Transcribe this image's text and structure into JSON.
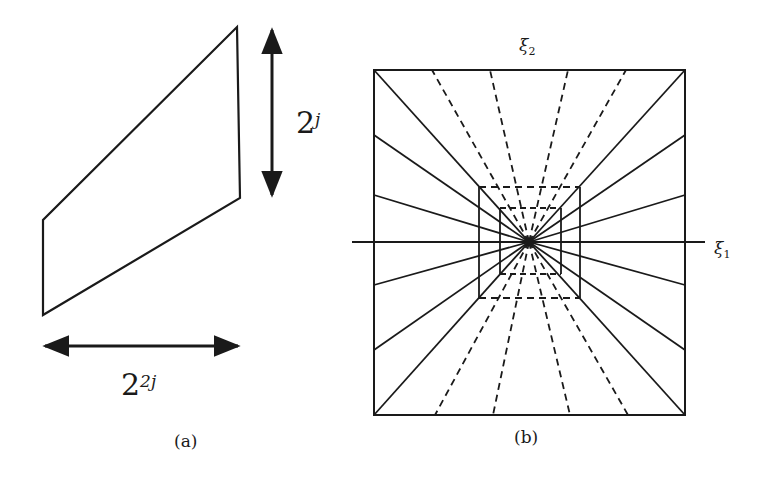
{
  "panel_a": {
    "caption": "(a)",
    "height_label_base": "2",
    "height_label_exp": "j",
    "width_label_base": "2",
    "width_label_exp": "2j",
    "parallelogram": [
      [
        237,
        27
      ],
      [
        240,
        198
      ],
      [
        43,
        315
      ],
      [
        43,
        220
      ]
    ],
    "vertical_arrow": {
      "x": 272,
      "y1": 28,
      "y2": 195
    },
    "horizontal_arrow": {
      "y": 346,
      "x1": 43,
      "x2": 240
    }
  },
  "panel_b": {
    "caption": "(b)",
    "axis_x_label": "ξ",
    "axis_x_sub": "1",
    "axis_y_label": "ξ",
    "axis_y_sub": "2",
    "outer_square": {
      "left": 374,
      "top": 70,
      "right": 685,
      "bottom": 415
    },
    "center": [
      529,
      242
    ],
    "solid_ray_side_y": [
      70,
      135,
      195,
      285,
      350,
      415
    ],
    "dashed_ray_top_x": [
      432,
      490,
      568,
      626
    ],
    "dashed_ray_bottom_x": [
      435,
      493,
      570,
      628
    ],
    "middle_box": {
      "left": 479,
      "top": 187,
      "right": 580,
      "bottom": 298
    },
    "inner_box": {
      "left": 500,
      "top": 208,
      "right": 561,
      "bottom": 274
    }
  },
  "colors": {
    "ink": "#1a1a1a",
    "background": "#ffffff"
  }
}
